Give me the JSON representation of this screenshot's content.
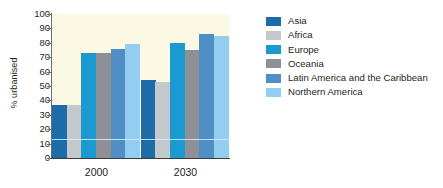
{
  "chart_data": {
    "type": "bar",
    "title": "",
    "xlabel": "",
    "ylabel": "% urbanised",
    "ylim": [
      0,
      100
    ],
    "ytick_step": 10,
    "yticks": [
      100,
      90,
      80,
      70,
      60,
      50,
      40,
      30,
      20,
      10,
      0
    ],
    "grid": false,
    "legend_position": "right",
    "categories": [
      "2000",
      "2030"
    ],
    "series": [
      {
        "name": "Asia",
        "color": "#1b6ca8",
        "values": [
          37,
          54
        ]
      },
      {
        "name": "Africa",
        "color": "#c3c8cc",
        "values": [
          37,
          53
        ]
      },
      {
        "name": "Europe",
        "color": "#1b9ad1",
        "values": [
          73,
          80
        ]
      },
      {
        "name": "Oceania",
        "color": "#8d9197",
        "values": [
          73,
          75
        ]
      },
      {
        "name": "Latin America and the Caribbean",
        "color": "#4f8fc6",
        "values": [
          76,
          86
        ]
      },
      {
        "name": "Northern America",
        "color": "#93cdef",
        "values": [
          79,
          85
        ]
      }
    ]
  },
  "legend": {
    "items": [
      {
        "label": "Asia",
        "color": "#1b6ca8"
      },
      {
        "label": "Africa",
        "color": "#c3c8cc"
      },
      {
        "label": "Europe",
        "color": "#1b9ad1"
      },
      {
        "label": "Oceania",
        "color": "#8d9197"
      },
      {
        "label": "Latin America and the Caribbean",
        "color": "#4f8fc6"
      },
      {
        "label": "Northern America",
        "color": "#93cdef"
      }
    ]
  },
  "axes": {
    "y_title": "% urbanised",
    "y_labels": [
      "100",
      "90",
      "80",
      "70",
      "60",
      "50",
      "40",
      "30",
      "20",
      "10",
      "0"
    ],
    "x_labels": [
      "2000",
      "2030"
    ]
  },
  "colors": {
    "plot_background": "#fbf8e3",
    "page_background": "#ffffff",
    "axis": "#3a3a3a",
    "text": "#231f20"
  }
}
